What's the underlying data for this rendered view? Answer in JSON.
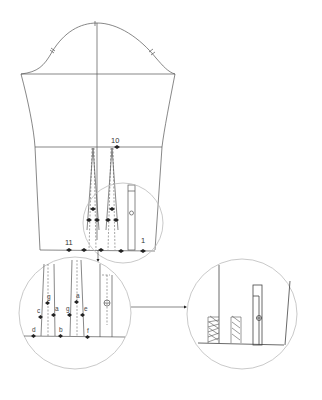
{
  "diagram": {
    "type": "sewing-pattern-sleeve",
    "labels": {
      "top_number": "10",
      "left_number": "11",
      "right_number": "1",
      "detail_a": "a",
      "detail_b": "b",
      "detail_c": "c",
      "detail_d": "d",
      "detail_e": "e",
      "detail_f": "f",
      "detail_g1": "g",
      "detail_g2": "g",
      "detail_g_upper": "g",
      "detail_a_upper": "a"
    },
    "colors": {
      "line": "#555555",
      "circle": "#bbbbbb",
      "marker": "#222222"
    }
  }
}
